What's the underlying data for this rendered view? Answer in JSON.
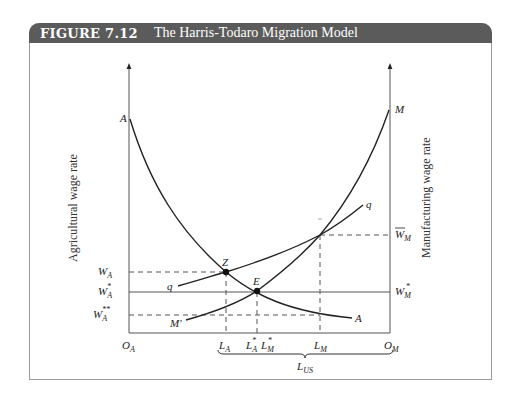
{
  "figure": {
    "number": "FIGURE 7.12",
    "title": "The Harris-Todaro Migration Model",
    "header_color": "#5b5b5b"
  },
  "axes": {
    "left_title": "Agricultural wage rate",
    "right_title": "Manufacturing wage rate",
    "left_origin": "O",
    "left_origin_sub": "A",
    "right_origin": "O",
    "right_origin_sub": "M"
  },
  "curves": {
    "A_top": "A",
    "A_end": "A",
    "M_top": "M",
    "M_start": "M'",
    "q_start": "q",
    "q_end": "q"
  },
  "points": {
    "Z": "Z",
    "E": "E"
  },
  "wage_labels": {
    "wa": "W",
    "wa_sub": "A",
    "wa_star": "W",
    "wa_star_sub": "A",
    "wa_star_sup": "*",
    "wa_dstar": "W",
    "wa_dstar_sub": "A",
    "wa_dstar_sup": "**",
    "wm_bar": "W",
    "wm_bar_sub": "M",
    "wm_star": "W",
    "wm_star_sub": "M",
    "wm_star_sup": "*"
  },
  "x_labels": {
    "la": "L",
    "la_sub": "A",
    "la_star": "L",
    "la_star_sub": "A",
    "la_star_sup": "*",
    "lm_star": "L",
    "lm_star_sub": "M",
    "lm_star_sup": "*",
    "lm": "L",
    "lm_sub": "M",
    "lus": "L",
    "lus_sub": "US"
  }
}
